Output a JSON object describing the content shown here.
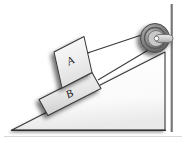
{
  "figure": {
    "title": "Two stacked blocks on an inclined plane connected over a pulley",
    "domain": "Diagram",
    "width": 186,
    "height": 141,
    "background_color": "#ffffff"
  },
  "labels": {
    "block_a": "A",
    "block_b": "B"
  },
  "elements": {
    "incline_name": "inclined-plane",
    "wall_name": "vertical-wall",
    "pulley_name": "pulley",
    "cord_upper_name": "cord-upper",
    "cord_lower_name": "cord-lower",
    "block_a_name": "block-a",
    "block_b_name": "block-b",
    "ground_name": "ground-line"
  },
  "colors": {
    "outline": "#3a3a3a",
    "block_fill_light": "#f2f2f2",
    "block_fill_dark": "#d9d9d9",
    "incline_fill": "#ffffff",
    "incline_shade": "#eeeeee",
    "pulley_outer": "#8a8a8a",
    "pulley_rim_dark": "#6e6e6e",
    "pulley_inner": "#c9c9c9",
    "pulley_hub": "#f4f4f4",
    "shadow": "#b9b9b9",
    "wall": "#7d7d7d",
    "label_text": "#1a1a1a"
  },
  "geometry": {
    "incline_angle_degrees": 27,
    "ground_y": 130,
    "apex_x": 165,
    "toe_x": 12
  }
}
